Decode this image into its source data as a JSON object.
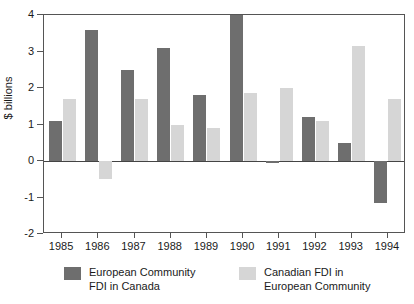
{
  "chart_data": {
    "type": "bar",
    "title": "",
    "subtitle": "",
    "xlabel": "",
    "ylabel": "$ billions",
    "categories": [
      "1985",
      "1986",
      "1987",
      "1988",
      "1989",
      "1990",
      "1991",
      "1992",
      "1993",
      "1994"
    ],
    "series": [
      {
        "name": "European Community FDI in Canada",
        "color": "#6e6e6e",
        "values": [
          1.1,
          3.6,
          2.5,
          3.1,
          1.8,
          4.0,
          -0.05,
          1.2,
          0.5,
          -1.15
        ],
        "notes": "1990 bar is clipped at the top of the axis (value is 4 or greater)"
      },
      {
        "name": "Canadian FDI in European Community",
        "color": "#d6d6d6",
        "values": [
          1.7,
          -0.5,
          1.7,
          1.0,
          0.9,
          1.85,
          2.0,
          1.1,
          3.15,
          1.7
        ]
      }
    ],
    "ylim": [
      -2,
      4
    ],
    "yticks": [
      4,
      3,
      2,
      1,
      0,
      -1,
      -2
    ],
    "ytick_labels": [
      "4",
      "3",
      "2",
      "1",
      "0",
      "-1",
      "-2"
    ],
    "grid": false,
    "legend_position": "bottom",
    "zero_line": true
  },
  "legend": {
    "entries": [
      {
        "label": "European Community\nFDI in Canada",
        "swatch": "dark"
      },
      {
        "label": "Canadian FDI in\nEuropean Community",
        "swatch": "light"
      }
    ]
  }
}
